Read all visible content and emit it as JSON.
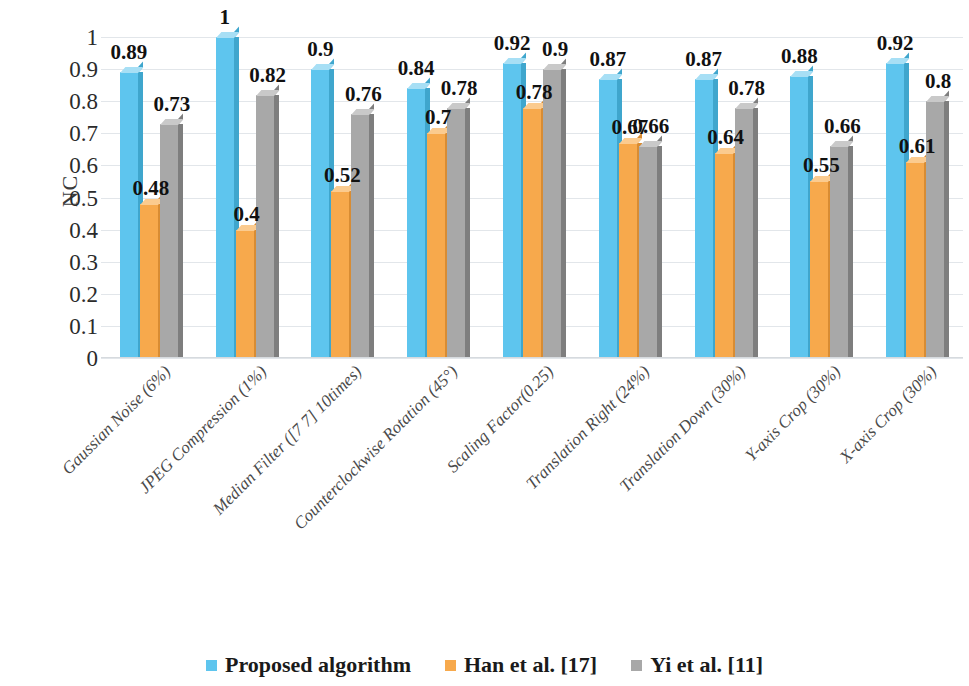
{
  "chart_data": {
    "type": "bar",
    "title": "",
    "xlabel": "",
    "ylabel": "NC",
    "ylim": [
      0,
      1
    ],
    "yticks": [
      "1",
      "0.9",
      "0.8",
      "0.7",
      "0.6",
      "0.5",
      "0.4",
      "0.3",
      "0.2",
      "0.1",
      "0"
    ],
    "ytick_values": [
      1,
      0.9,
      0.8,
      0.7,
      0.6,
      0.5,
      0.4,
      0.3,
      0.2,
      0.1,
      0
    ],
    "grid": true,
    "legend_position": "bottom",
    "categories": [
      "Gaussian Noise (6%)",
      "JPEG Compression (1%)",
      "Median Filter ([7 7] 10times)",
      "Counterclockwise Rotation (45°)",
      "Scaling Factor(0.25)",
      "Translation Right (24%)",
      "Translation Down (30%)",
      "Y-axis Crop (30%)",
      "X-axis Crop (30%)"
    ],
    "series": [
      {
        "name": "Proposed  algorithm",
        "color": "#5EC5EE",
        "values": [
          0.89,
          1,
          0.9,
          0.84,
          0.92,
          0.87,
          0.87,
          0.88,
          0.92
        ],
        "labels": [
          "0.89",
          "1",
          "0.9",
          "0.84",
          "0.92",
          "0.87",
          "0.87",
          "0.88",
          "0.92"
        ]
      },
      {
        "name": "Han et al. [17]",
        "color": "#F7A94C",
        "values": [
          0.48,
          0.4,
          0.52,
          0.7,
          0.78,
          0.67,
          0.64,
          0.55,
          0.61
        ],
        "labels": [
          "0.48",
          "0.4",
          "0.52",
          "0.7",
          "0.78",
          "0.67",
          "0.64",
          "0.55",
          "0.61"
        ]
      },
      {
        "name": "Yi et al. [11]",
        "color": "#A8A8A8",
        "values": [
          0.73,
          0.82,
          0.76,
          0.78,
          0.9,
          0.66,
          0.78,
          0.66,
          0.8
        ],
        "labels": [
          "0.73",
          "0.82",
          "0.76",
          "0.78",
          "0.9",
          "0.66",
          "0.78",
          "0.66",
          "0.8"
        ]
      }
    ]
  }
}
